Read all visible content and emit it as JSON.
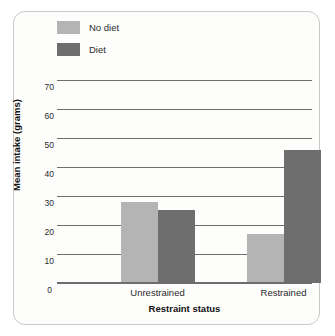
{
  "chart_data": {
    "type": "bar",
    "title": "",
    "xlabel": "Restraint status",
    "ylabel": "Mean intake (grams)",
    "categories": [
      "Unrestrained",
      "Restrained"
    ],
    "series": [
      {
        "name": "No diet",
        "color": "#b4b4b4",
        "values": [
          28,
          17
        ]
      },
      {
        "name": "Diet",
        "color": "#6e6e6e",
        "values": [
          25,
          46
        ]
      }
    ],
    "ylim": [
      0,
      70
    ],
    "yticks": [
      0,
      10,
      20,
      30,
      40,
      50,
      60,
      70
    ],
    "ytick_labels": [
      "0",
      "10",
      "20",
      "30",
      "40",
      "50",
      "60",
      "70"
    ],
    "grid": true,
    "legend_position": "top-left",
    "gridline_color": "#6d6d6d",
    "background_color": "#fdfdfc",
    "frame_color": "#c9c9c9"
  }
}
